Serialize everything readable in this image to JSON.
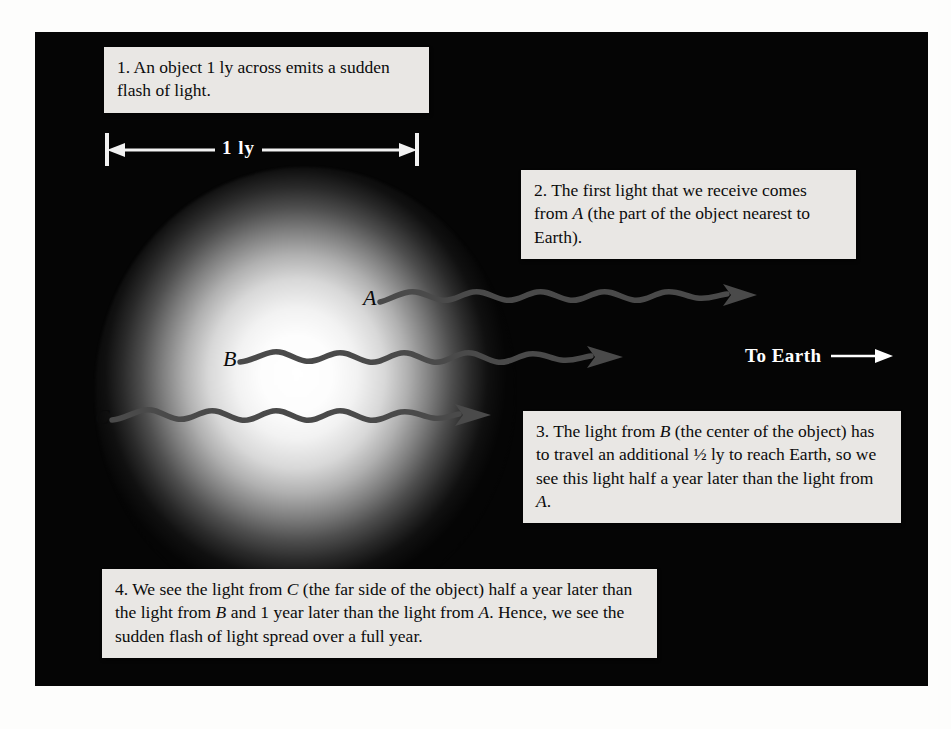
{
  "figure": {
    "background_color": "#050505",
    "page_color": "#fdfdfc",
    "glow_color": "#ffffff",
    "ray_color": "#4a4a4a",
    "caption_bg": "#e9e7e4"
  },
  "scale_bar": {
    "label": "1 ly",
    "style": "double-headed-arrow"
  },
  "direction_marker": {
    "label": "To Earth",
    "arrow": "→"
  },
  "rays": [
    {
      "id": "A",
      "label": "A",
      "description": "light ray from near side of object"
    },
    {
      "id": "B",
      "label": "B",
      "description": "light ray from center of object"
    },
    {
      "id": "C",
      "label": "C",
      "description": "light ray from far side of object"
    }
  ],
  "captions": [
    {
      "number": "1",
      "text": "1. An object 1 ly across emits a sudden flash of light.",
      "html": "1. An object 1 ly across emits a sudden flash of light."
    },
    {
      "number": "2",
      "text": "2. The first light that we receive comes from A (the part of the object nearest to Earth).",
      "html": "2. The first light that we receive comes from <i>A</i> (the part of the object nearest to Earth)."
    },
    {
      "number": "3",
      "text": "3. The light from B (the center of the object) has to travel an additional ½ ly to reach Earth, so we see this light half a year later than the light from A.",
      "html": "3. The light from <i>B</i> (the center of the object) has to travel an additional ½ ly to reach Earth, so we see this light half a year later than the light from <i>A</i>."
    },
    {
      "number": "4",
      "text": "4. We see the light from C (the far side of the object) half a year later than the light from B and 1 year later than the light from A. Hence, we see the sudden flash of light spread over a full year.",
      "html": "4. We see the light from <i>C</i> (the far side of the object) half a year later than the light from <i>B</i> and 1 year later than the light from <i>A</i>. Hence, we see the sudden flash of light spread over a full year."
    }
  ]
}
